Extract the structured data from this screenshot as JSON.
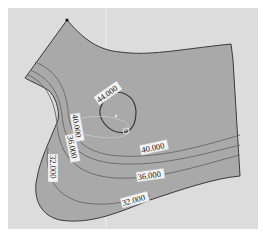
{
  "diagram": {
    "type": "contour-surface",
    "colors": {
      "background": "#ffffff",
      "panel": "#dcdcdc",
      "surface": "#a9a9a9",
      "contour": "#6e6e6e",
      "boundary": "#3a3a3a",
      "label_bg": "#f4f4f4"
    },
    "contours": [
      {
        "level": "44.000",
        "label": "44.000"
      },
      {
        "level": "40.000",
        "label_left": "40.000",
        "label_right": "40.000"
      },
      {
        "level": "36.000",
        "label_left": "36.000",
        "label_right": "36.000"
      },
      {
        "level": "32.000",
        "label_left": "32.000",
        "label_bottom": "32.000"
      }
    ],
    "labels": {
      "c44": "44.000",
      "c40_left": "40.000",
      "c40_right": "40.000",
      "c36_left": "36.000",
      "c36_right": "36.000",
      "c32_left": "32.000",
      "c32_bottom": "32.000"
    }
  }
}
